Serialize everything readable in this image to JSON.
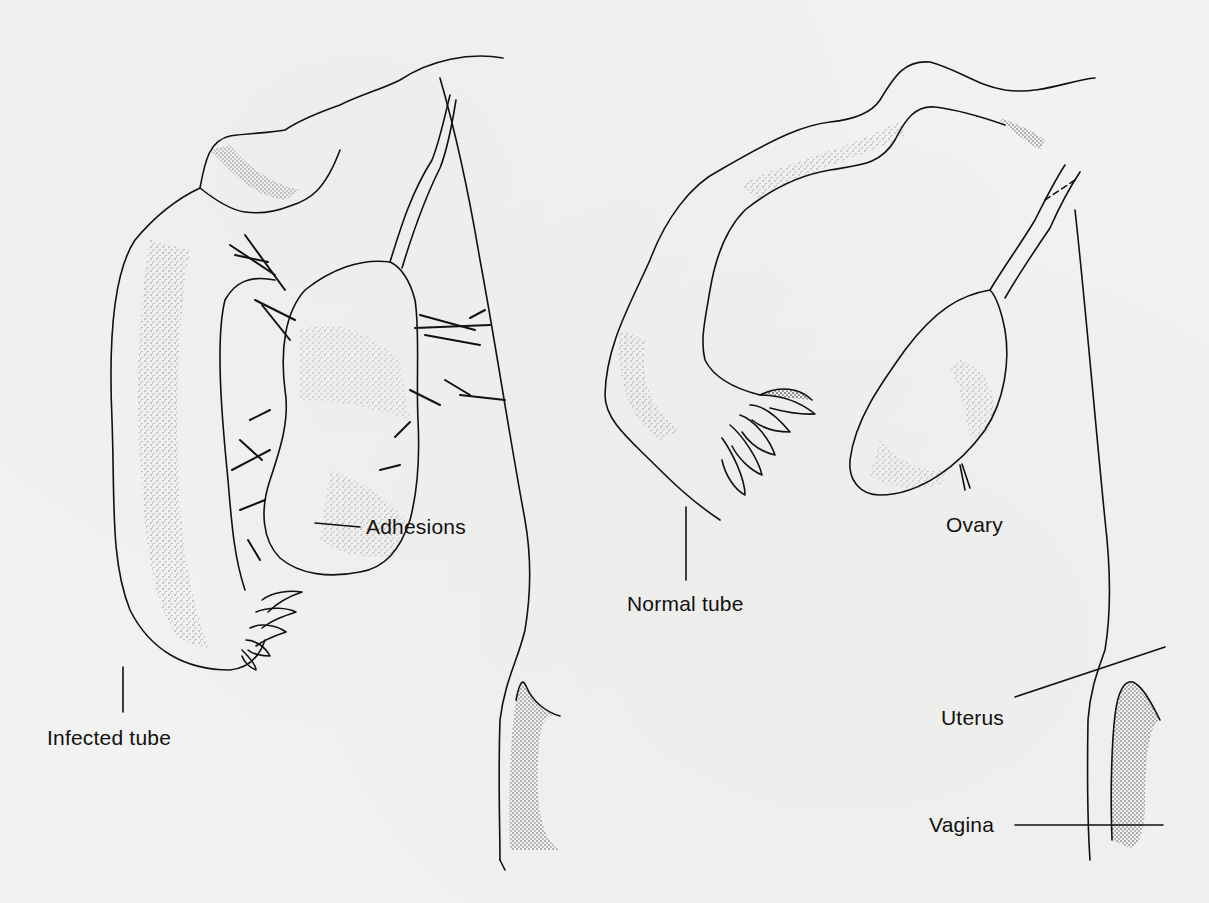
{
  "figure": {
    "type": "anatomical illustration",
    "ink_color": "#111111",
    "background_color": "#f2f2f0"
  },
  "labels": {
    "adhesions": "Adhesions",
    "infected_tube": "Infected tube",
    "normal_tube": "Normal tube",
    "ovary": "Ovary",
    "uterus": "Uterus",
    "vagina": "Vagina"
  }
}
